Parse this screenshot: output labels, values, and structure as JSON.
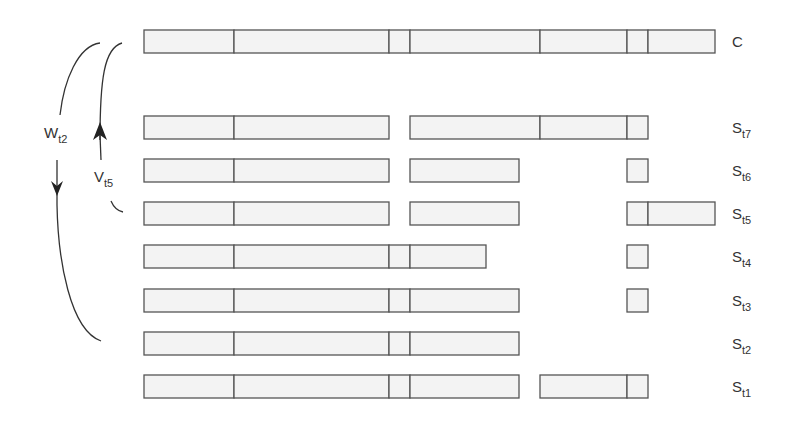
{
  "diagram": {
    "boundaries": [
      144,
      234,
      389,
      410,
      540,
      627,
      648,
      715
    ],
    "rows": [
      {
        "id": "C",
        "label": "C",
        "sub": "",
        "y": 30,
        "segments": [
          [
            0,
            1
          ],
          [
            1,
            2
          ],
          [
            2,
            3
          ],
          [
            3,
            4
          ],
          [
            4,
            5
          ],
          [
            5,
            6
          ],
          [
            6,
            7
          ]
        ],
        "groups": [
          [
            0,
            7
          ]
        ]
      },
      {
        "id": "S7",
        "label": "S",
        "sub": "t7",
        "y": 116,
        "segments": [
          [
            0,
            1
          ],
          [
            1,
            2
          ],
          [
            3,
            4
          ],
          [
            4,
            5
          ],
          [
            5,
            6
          ]
        ],
        "groups": [
          [
            0,
            2
          ],
          [
            3,
            6
          ]
        ]
      },
      {
        "id": "S6",
        "label": "S",
        "sub": "t6",
        "y": 159,
        "segments": [
          [
            0,
            1
          ],
          [
            1,
            2
          ],
          [
            3,
            "519"
          ],
          [
            5,
            6
          ]
        ],
        "groups": []
      },
      {
        "id": "S5",
        "label": "S",
        "sub": "t5",
        "y": 202,
        "segments": [
          [
            0,
            1
          ],
          [
            1,
            2
          ],
          [
            3,
            "519"
          ],
          [
            5,
            6
          ],
          [
            6,
            7
          ]
        ],
        "groups": []
      },
      {
        "id": "S4",
        "label": "S",
        "sub": "t4",
        "y": 245,
        "segments": [
          [
            0,
            1
          ],
          [
            1,
            2
          ],
          [
            2,
            3
          ],
          [
            3,
            "486"
          ],
          [
            5,
            6
          ]
        ],
        "groups": []
      },
      {
        "id": "S3",
        "label": "S",
        "sub": "t3",
        "y": 289,
        "segments": [
          [
            0,
            1
          ],
          [
            1,
            2
          ],
          [
            2,
            3
          ],
          [
            3,
            "519"
          ],
          [
            5,
            6
          ]
        ],
        "groups": []
      },
      {
        "id": "S2",
        "label": "S",
        "sub": "t2",
        "y": 332,
        "segments": [
          [
            0,
            1
          ],
          [
            1,
            2
          ],
          [
            2,
            3
          ],
          [
            3,
            "519"
          ]
        ],
        "groups": []
      },
      {
        "id": "S1",
        "label": "S",
        "sub": "t1",
        "y": 375,
        "segments": [
          [
            0,
            1
          ],
          [
            1,
            2
          ],
          [
            2,
            3
          ],
          [
            3,
            "519"
          ],
          [
            "540",
            5
          ],
          [
            5,
            6
          ]
        ],
        "groups": []
      }
    ],
    "row_height": 23,
    "label_x": 732,
    "arrows": {
      "w": {
        "label": "W",
        "sub": "t2",
        "direction": "down"
      },
      "v": {
        "label": "V",
        "sub": "t5",
        "direction": "up"
      }
    },
    "colors": {
      "fill": "#f3f3f3",
      "stroke": "#555555",
      "text": "#333333"
    }
  }
}
